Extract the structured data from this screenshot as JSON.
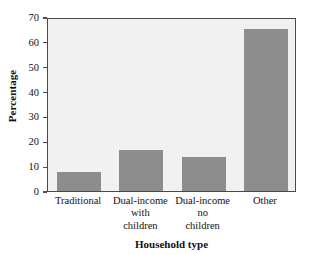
{
  "chart_data": {
    "type": "bar",
    "title": "",
    "categories": [
      "Traditional",
      "Dual-income with children",
      "Dual-income no children",
      "Other"
    ],
    "category_lines": [
      [
        "Traditional"
      ],
      [
        "Dual-income",
        "with",
        "children"
      ],
      [
        "Dual-income",
        "no",
        "children"
      ],
      [
        "Other"
      ]
    ],
    "values": [
      7.5,
      16.5,
      13.5,
      65
    ],
    "xlabel": "Household type",
    "ylabel": "Percentage",
    "ylim": [
      0,
      70
    ],
    "yticks": [
      0,
      10,
      20,
      30,
      40,
      50,
      60,
      70
    ],
    "ytick_labels": [
      "0",
      "10",
      "20",
      "30",
      "40",
      "50",
      "60",
      "70"
    ],
    "grid": false,
    "legend": null,
    "bar_color": "#8d8d8d",
    "plot_background": "#f1f1f1",
    "frame_color": "#4a4a4a",
    "figure_background": "#ffffff"
  }
}
